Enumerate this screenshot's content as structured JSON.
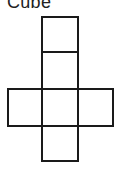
{
  "title": "Cube",
  "diagram": {
    "type": "cube-net",
    "stroke_color": "#1a1a1a",
    "faces": [
      {
        "id": "face-top",
        "x": 42,
        "y": 17,
        "w": 36,
        "h": 35
      },
      {
        "id": "face-upper-middle",
        "x": 42,
        "y": 52,
        "w": 36,
        "h": 37
      },
      {
        "id": "face-left",
        "x": 8,
        "y": 89,
        "w": 34,
        "h": 37
      },
      {
        "id": "face-center",
        "x": 42,
        "y": 89,
        "w": 36,
        "h": 37
      },
      {
        "id": "face-right",
        "x": 78,
        "y": 89,
        "w": 35,
        "h": 37
      },
      {
        "id": "face-bottom",
        "x": 42,
        "y": 126,
        "w": 36,
        "h": 35
      }
    ]
  }
}
